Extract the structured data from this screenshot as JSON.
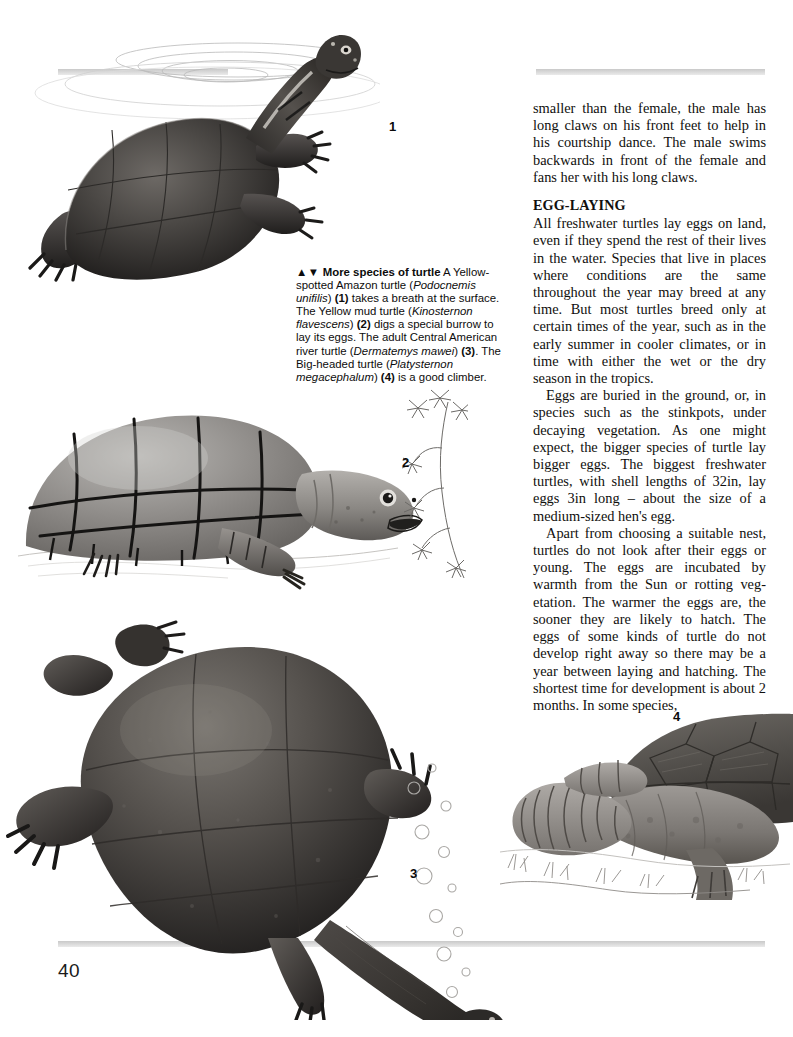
{
  "page": {
    "number": "40",
    "background_color": "#ffffff",
    "rule_color": "#d2d2d2",
    "text_color": "#100f0d"
  },
  "body_column": {
    "paragraphs": [
      {
        "style": "continued",
        "text": "smaller than the female, the male has long claws on his front feet to help in his courtship dance. The male swims backwards in front of the female and fans her with his long claws."
      }
    ],
    "section_heading": "EGG-LAYING",
    "section_paragraphs": [
      {
        "style": "flush",
        "text": "All freshwater turtles lay eggs on land, even if they spend the rest of their lives in the water. Species that live in places where conditions are the same throughout the year may breed at any time. But most turtles breed only at certain times of the year, such as in the early summer in cooler climates, or in time with either the wet or the dry season in the tropics."
      },
      {
        "style": "indent",
        "text": "Eggs are buried in the ground, or, in species such as the stinkpots, under decaying vegetation. As one might expect, the bigger species of turtle lay bigger eggs. The biggest freshwater turtles, with shell lengths of 32in, lay eggs 3in long – about the size of a medium-sized hen's egg."
      },
      {
        "style": "indent",
        "text": "Apart from choosing a suitable nest, turtles do not look after their eggs or young. The eggs are incubated by warmth from the Sun or rotting veg-etation. The warmer the eggs are, the sooner they are likely to hatch. The eggs of some kinds of turtle do not develop right away so there may be a year between laying and hatching. The shortest time for development is about 2 months. In some species,"
      }
    ]
  },
  "caption": {
    "markers": "▲▼",
    "lead_in": "More species of turtle",
    "segments": [
      {
        "type": "plain",
        "text": " A Yellow-spotted Amazon turtle ("
      },
      {
        "type": "italic",
        "text": "Podocnemis unifilis"
      },
      {
        "type": "plain",
        "text": ") "
      },
      {
        "type": "bold",
        "text": "(1)"
      },
      {
        "type": "plain",
        "text": " takes a breath at the surface. The Yellow mud turtle ("
      },
      {
        "type": "italic",
        "text": "Kinosternon flavescens"
      },
      {
        "type": "plain",
        "text": ") "
      },
      {
        "type": "bold",
        "text": "(2)"
      },
      {
        "type": "plain",
        "text": " digs a special burrow to lay its eggs. The adult Central American river turtle ("
      },
      {
        "type": "italic",
        "text": "Dermatemys mawei"
      },
      {
        "type": "plain",
        "text": ") "
      },
      {
        "type": "bold",
        "text": "(3)"
      },
      {
        "type": "plain",
        "text": ". The Big-headed turtle ("
      },
      {
        "type": "italic",
        "text": "Platysternon megacephalum"
      },
      {
        "type": "plain",
        "text": ") "
      },
      {
        "type": "bold",
        "text": "(4)"
      },
      {
        "type": "plain",
        "text": " is a good climber."
      }
    ]
  },
  "figures": [
    {
      "id": "fig1",
      "label": "1",
      "subject": "Yellow-spotted Amazon turtle taking a breath at the water surface",
      "species": "Podocnemis unifilis",
      "details": "dark carapace, head breaking surface, concentric ripple rings"
    },
    {
      "id": "fig2",
      "label": "2",
      "subject": "Yellow mud turtle on sandy ground with open mouth",
      "species": "Kinosternon flavescens",
      "details": "domed grey shell with bold scute outlines, spiky plant at right"
    },
    {
      "id": "fig3",
      "label": "3",
      "subject": "Central American river turtle swimming, seen from above",
      "species": "Dermatemys mawei",
      "details": "large dark oval carapace, splayed limbs, long neck, rising bubbles"
    },
    {
      "id": "fig4",
      "label": "4",
      "subject": "Big-headed turtle with long segmented tail on vegetated ground",
      "species": "Platysternon megacephalum",
      "details": "textured carapace, thick neck, tail curling to the left"
    }
  ]
}
